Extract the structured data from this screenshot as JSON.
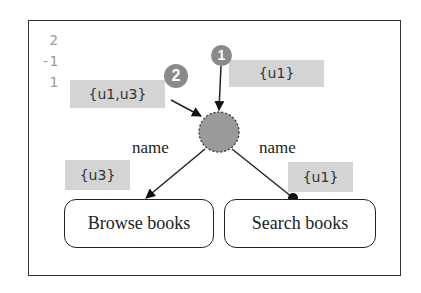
{
  "diagram": {
    "line_numbers": [
      "2",
      "-1",
      "1"
    ],
    "tags": {
      "top_right": "{u1}",
      "left": "{u1,u3}",
      "browse": "{u3}",
      "search": "{u1}"
    },
    "badges": {
      "first": "1",
      "second": "2"
    },
    "edge_labels": {
      "left": "name",
      "right": "name"
    },
    "nodes": {
      "browse": "Browse books",
      "search": "Search books"
    },
    "colors": {
      "tag_bg": "#d4d4d4",
      "badge_bg": "#8a8a8a",
      "center_node": "#9a9a9a"
    }
  }
}
